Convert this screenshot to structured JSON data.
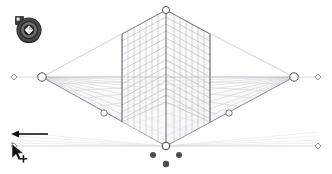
{
  "app": {
    "tool_name": "Perspective Grid Tool",
    "document_mode": "Two Point Perspective",
    "canvas_width": 332,
    "canvas_height": 174,
    "background_color": "#ffffff"
  },
  "colors": {
    "grid_line_light": "#c9c9d2",
    "grid_line_mid": "#a8a8b4",
    "grid_line_dark": "#6e6e7a",
    "horizon_line": "#b9b9c4",
    "handle_stroke": "#4a4a55",
    "handle_fill": "#ffffff",
    "widget_dark": "#3f3f3f",
    "widget_mid": "#6b6b6b",
    "widget_light": "#d4d4d4",
    "cursor_black": "#1a1a1a",
    "arrow_black": "#111111"
  },
  "widget": {
    "name": "plane-switching-widget",
    "label": "Plane Switching Widget",
    "active_plane": "left-grid-plane",
    "planes": [
      "left-grid-plane",
      "right-grid-plane",
      "horizontal-grid-plane"
    ]
  },
  "annotation": {
    "arrow_label": "drag direction",
    "arrow_direction": "left",
    "arrow_x1": 48,
    "arrow_y1": 134,
    "arrow_x2": 13,
    "arrow_y2": 134
  },
  "cursor": {
    "name": "selection-cursor-move",
    "label": "Selection cursor with move badge",
    "x": 14,
    "y": 146
  },
  "chart_data": {
    "type": "scatter",
    "xlabel": "",
    "ylabel": "",
    "grid": true,
    "handles": [
      {
        "id": "vertical-extent-handle-top",
        "label": "Vertical Extent (top)",
        "shape": "circle",
        "x": 166,
        "y": 10,
        "r": 3.6
      },
      {
        "id": "left-vanishing-point",
        "label": "Left Vanishing Point",
        "shape": "circle",
        "x": 42,
        "y": 77,
        "r": 4.2
      },
      {
        "id": "right-vanishing-point",
        "label": "Right Vanishing Point",
        "shape": "circle",
        "x": 294,
        "y": 77,
        "r": 4.2
      },
      {
        "id": "horizon-left-handle",
        "label": "Horizon Level (left)",
        "shape": "diamond",
        "x": 14,
        "y": 77,
        "r": 3.0
      },
      {
        "id": "horizon-right-handle",
        "label": "Horizon Level (right)",
        "shape": "diamond",
        "x": 318,
        "y": 77,
        "r": 3.0
      },
      {
        "id": "ground-level-left-handle",
        "label": "Ground Level (left)",
        "shape": "diamond",
        "x": 14,
        "y": 146,
        "r": 3.0
      },
      {
        "id": "ground-level-right-handle",
        "label": "Ground Level (right)",
        "shape": "diamond",
        "x": 318,
        "y": 146,
        "r": 3.0
      },
      {
        "id": "left-grid-extent-handle",
        "label": "Left Grid Plane Extent",
        "shape": "circle",
        "x": 104,
        "y": 113,
        "r": 3.2
      },
      {
        "id": "right-grid-extent-handle",
        "label": "Right Grid Plane Extent",
        "shape": "circle",
        "x": 229,
        "y": 113,
        "r": 3.2
      },
      {
        "id": "station-point-handle",
        "label": "Station Point / Origin",
        "shape": "circle",
        "x": 166,
        "y": 146,
        "r": 3.8
      },
      {
        "id": "horizontal-grid-plane-control",
        "label": "Horizontal Grid Plane Control",
        "shape": "dot",
        "x": 166,
        "y": 164,
        "r": 3.2
      },
      {
        "id": "left-grid-plane-control",
        "label": "Left Grid Plane Control",
        "shape": "dot",
        "x": 153,
        "y": 155,
        "r": 3.0
      },
      {
        "id": "right-grid-plane-control",
        "label": "Right Grid Plane Control",
        "shape": "dot",
        "x": 179,
        "y": 155,
        "r": 3.0
      }
    ],
    "guides": [
      {
        "id": "horizon-line",
        "label": "Horizon Line",
        "y": 77,
        "x1": 14,
        "x2": 318
      },
      {
        "id": "ground-line",
        "label": "Ground Line",
        "y": 146,
        "x1": 14,
        "x2": 318
      },
      {
        "id": "vertical-axis-line",
        "label": "Vertical Axis Line",
        "x": 166,
        "y1": 10,
        "y2": 146
      }
    ],
    "planes": [
      {
        "id": "left-grid-plane",
        "label": "Left Grid Plane",
        "cells_x": 8,
        "cells_y": 12
      },
      {
        "id": "right-grid-plane",
        "label": "Right Grid Plane",
        "cells_x": 8,
        "cells_y": 12
      },
      {
        "id": "horizontal-grid-plane",
        "label": "Horizontal Grid Plane",
        "cells_x": 16,
        "cells_y": 10
      }
    ]
  }
}
